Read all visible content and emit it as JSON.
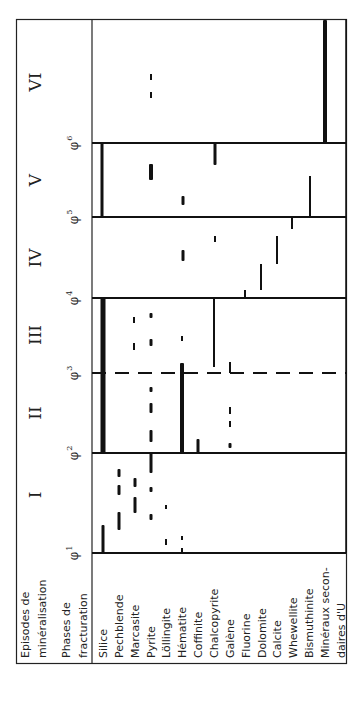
{
  "header": {
    "episodes_label": [
      "Episodes de",
      "minéralisation"
    ],
    "phases_label": [
      "Phases de",
      "fracturation"
    ]
  },
  "episodes": [
    {
      "label": "I",
      "y": 495
    },
    {
      "label": "II",
      "y": 413
    },
    {
      "label": "III",
      "y": 335
    },
    {
      "label": "IV",
      "y": 258
    },
    {
      "label": "V",
      "y": 180
    },
    {
      "label": "VI",
      "y": 82
    }
  ],
  "phases": [
    {
      "label": "φ",
      "sub": "1",
      "y": 553,
      "style": "solid"
    },
    {
      "label": "φ",
      "sub": "2",
      "y": 453,
      "style": "solid"
    },
    {
      "label": "φ",
      "sub": "3",
      "y": 373,
      "style": "dashed"
    },
    {
      "label": "φ",
      "sub": "4",
      "y": 298,
      "style": "solid"
    },
    {
      "label": "φ",
      "sub": "5",
      "y": 217,
      "style": "solid"
    },
    {
      "label": "φ",
      "sub": "6",
      "y": 143,
      "style": "solid"
    }
  ],
  "minerals": [
    {
      "name": "Silice",
      "x": 103
    },
    {
      "name": "Pechblende",
      "x": 119
    },
    {
      "name": "Marcasite",
      "x": 135
    },
    {
      "name": "Pyrite",
      "x": 151
    },
    {
      "name": "Löllingite",
      "x": 166
    },
    {
      "name": "Hématite",
      "x": 182
    },
    {
      "name": "Coffinite",
      "x": 198
    },
    {
      "name": "Chalcopyrite",
      "x": 214
    },
    {
      "name": "Galène",
      "x": 230
    },
    {
      "name": "Fluorine",
      "x": 246
    },
    {
      "name": "Dolomite",
      "x": 262
    },
    {
      "name": "Calcite",
      "x": 277
    },
    {
      "name": "Whewellite",
      "x": 293
    },
    {
      "name": "Bismuthinite",
      "x": 309
    },
    {
      "name": "Minéraux secon-",
      "x": 325
    },
    {
      "name": "daires d'U",
      "x": 341
    }
  ],
  "bars": [
    {
      "mineral": "Silice",
      "x": 103,
      "y1": 525,
      "y2": 553,
      "w": 3
    },
    {
      "mineral": "Pechblende",
      "x": 119,
      "y1": 512,
      "y2": 530,
      "w": 3
    },
    {
      "mineral": "Pechblende",
      "x": 119,
      "y1": 485,
      "y2": 495,
      "w": 3
    },
    {
      "mineral": "Pechblende",
      "x": 119,
      "y1": 469,
      "y2": 477,
      "w": 3
    },
    {
      "mineral": "Marcasite",
      "x": 135,
      "y1": 497,
      "y2": 513,
      "w": 3
    },
    {
      "mineral": "Marcasite",
      "x": 135,
      "y1": 478,
      "y2": 487,
      "w": 3
    },
    {
      "mineral": "Pyrite",
      "x": 151,
      "y1": 453,
      "y2": 473,
      "w": 3
    },
    {
      "mineral": "Pyrite",
      "x": 151,
      "y1": 487,
      "y2": 492,
      "w": 3
    },
    {
      "mineral": "Pyrite",
      "x": 151,
      "y1": 514,
      "y2": 520,
      "w": 3
    },
    {
      "mineral": "Löllingite",
      "x": 166,
      "y1": 505,
      "y2": 509,
      "w": 2
    },
    {
      "mineral": "Löllingite",
      "x": 166,
      "y1": 539,
      "y2": 545,
      "w": 2
    },
    {
      "mineral": "Hématite",
      "x": 182,
      "y1": 536,
      "y2": 540,
      "w": 2
    },
    {
      "mineral": "Hématite",
      "x": 182,
      "y1": 548,
      "y2": 553,
      "w": 2
    },
    {
      "mineral": "Silice",
      "x": 103,
      "y1": 298,
      "y2": 453,
      "w": 5
    },
    {
      "mineral": "Pyrite",
      "x": 151,
      "y1": 313,
      "y2": 318,
      "w": 3
    },
    {
      "mineral": "Pyrite",
      "x": 151,
      "y1": 339,
      "y2": 346,
      "w": 3
    },
    {
      "mineral": "Pyrite",
      "x": 151,
      "y1": 387,
      "y2": 392,
      "w": 3
    },
    {
      "mineral": "Pyrite",
      "x": 151,
      "y1": 403,
      "y2": 413,
      "w": 3
    },
    {
      "mineral": "Pyrite",
      "x": 151,
      "y1": 430,
      "y2": 442,
      "w": 3
    },
    {
      "mineral": "Marcasite",
      "x": 134,
      "y1": 317,
      "y2": 323,
      "w": 2
    },
    {
      "mineral": "Marcasite",
      "x": 134,
      "y1": 343,
      "y2": 350,
      "w": 2
    },
    {
      "mineral": "Hématite",
      "x": 182,
      "y1": 336,
      "y2": 341,
      "w": 2
    },
    {
      "mineral": "Hématite",
      "x": 182,
      "y1": 363,
      "y2": 453,
      "w": 4
    },
    {
      "mineral": "Coffinite",
      "x": 198,
      "y1": 439,
      "y2": 453,
      "w": 3
    },
    {
      "mineral": "Chalcopyrite",
      "x": 214,
      "y1": 298,
      "y2": 367,
      "w": 2
    },
    {
      "mineral": "Galène",
      "x": 230,
      "y1": 362,
      "y2": 373,
      "w": 2
    },
    {
      "mineral": "Galène",
      "x": 230,
      "y1": 407,
      "y2": 414,
      "w": 2
    },
    {
      "mineral": "Galène",
      "x": 230,
      "y1": 421,
      "y2": 427,
      "w": 2
    },
    {
      "mineral": "Galène",
      "x": 230,
      "y1": 443,
      "y2": 448,
      "w": 3
    },
    {
      "mineral": "Fluorine",
      "x": 245,
      "y1": 290,
      "y2": 298,
      "w": 2
    },
    {
      "mineral": "Dolomite",
      "x": 261,
      "y1": 264,
      "y2": 290,
      "w": 2
    },
    {
      "mineral": "Calcite",
      "x": 277,
      "y1": 236,
      "y2": 264,
      "w": 2
    },
    {
      "mineral": "Whewellite",
      "x": 292,
      "y1": 217,
      "y2": 229,
      "w": 2
    },
    {
      "mineral": "Chalcopyrite",
      "x": 215,
      "y1": 236,
      "y2": 242,
      "w": 2
    },
    {
      "mineral": "Hématite",
      "x": 183,
      "y1": 250,
      "y2": 261,
      "w": 3
    },
    {
      "mineral": "Silice",
      "x": 102,
      "y1": 143,
      "y2": 217,
      "w": 3
    },
    {
      "mineral": "Pyrite",
      "x": 151,
      "y1": 164,
      "y2": 180,
      "w": 4
    },
    {
      "mineral": "Hématite",
      "x": 183,
      "y1": 196,
      "y2": 205,
      "w": 3
    },
    {
      "mineral": "Chalcopyrite",
      "x": 215,
      "y1": 143,
      "y2": 165,
      "w": 3
    },
    {
      "mineral": "Bismuthinite",
      "x": 310,
      "y1": 176,
      "y2": 217,
      "w": 2
    },
    {
      "mineral": "Pyrite",
      "x": 151,
      "y1": 74,
      "y2": 80,
      "w": 2
    },
    {
      "mineral": "Pyrite",
      "x": 151,
      "y1": 92,
      "y2": 98,
      "w": 2
    },
    {
      "mineral": "Minéraux secondaires d'U",
      "x": 325,
      "y1": 20,
      "y2": 143,
      "w": 4
    }
  ],
  "colors": {
    "ink": "#111111",
    "background": "#ffffff"
  }
}
